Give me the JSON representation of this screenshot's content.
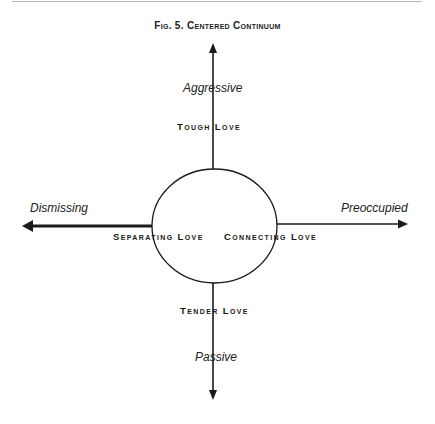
{
  "figure": {
    "title": "Fig. 5. Centered Continuum"
  },
  "axes": {
    "top": "Aggressive",
    "bottom": "Passive",
    "left": "Dismissing",
    "right": "Preoccupied"
  },
  "quadrant_labels": {
    "top": "Tough Love",
    "bottom": "Tender Love",
    "left": "Separating Love",
    "right": "Connecting Love"
  },
  "colors": {
    "line": "#1a1a1a",
    "background": "#ffffff"
  }
}
